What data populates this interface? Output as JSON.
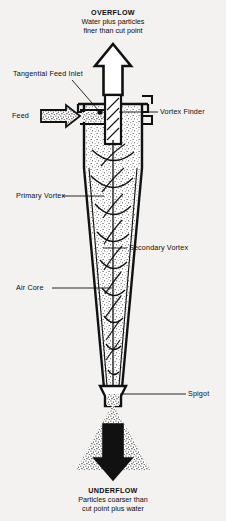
{
  "figure": {
    "background_color": "#f3f2f0",
    "ink_color": "#0d0d0d"
  },
  "captions": {
    "overflow": {
      "heading": "OVERFLOW",
      "line1": "Water plus particles",
      "line2": "finer than cut point"
    },
    "underflow": {
      "heading": "UNDERFLOW",
      "line1": "Particles coarser than",
      "line2": "cut point plus water"
    }
  },
  "labels": {
    "tangential_feed_inlet": "Tangential Feed Inlet",
    "feed": "Feed",
    "vortex_finder": "Vortex Finder",
    "primary_vortex": "Primary Vortex",
    "secondary_vortex": "Secondary Vortex",
    "air_core": "Air Core",
    "spigot": "Spigot"
  },
  "icons": {
    "overflow_arrow": "arrow-up-outline-icon",
    "feed_arrow": "arrow-right-stippled-icon",
    "underflow_arrow": "arrow-down-solid-icon",
    "underflow_spray": "particle-spray-icon"
  }
}
